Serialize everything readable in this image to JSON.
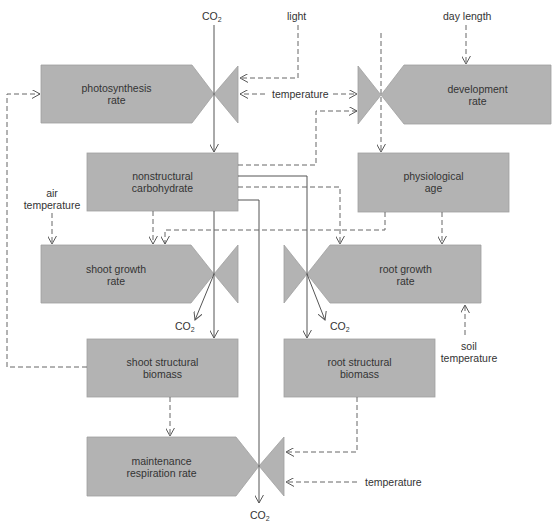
{
  "diagram": {
    "type": "flow/relational diagram (Forrester style)",
    "colors": {
      "box_fill": "#b3b3b3",
      "box_stroke": "#9a9a9a",
      "line": "#555555"
    },
    "nodes": {
      "photosynthesis": {
        "line1": "photosynthesis",
        "line2": "rate"
      },
      "development": {
        "line1": "development",
        "line2": "rate"
      },
      "nonstructural": {
        "line1": "nonstructural",
        "line2": "carbohydrate"
      },
      "physiological": {
        "line1": "physiological",
        "line2": "age"
      },
      "shoot_growth": {
        "line1": "shoot growth",
        "line2": "rate"
      },
      "root_growth": {
        "line1": "root growth",
        "line2": "rate"
      },
      "shoot_structural": {
        "line1": "shoot structural",
        "line2": "biomass"
      },
      "root_structural": {
        "line1": "root structural",
        "line2": "biomass"
      },
      "maintenance": {
        "line1": "maintenance",
        "line2": "respiration rate"
      }
    },
    "inputs": {
      "co2_top": "CO",
      "light": "light",
      "temperature_top": "temperature",
      "day_length": "day length",
      "air_temp_1": "air",
      "air_temp_2": "temperature",
      "soil_temp_1": "soil",
      "soil_temp_2": "temperature",
      "temperature_bottom": "temperature"
    },
    "outputs": {
      "co2_shoot": "CO",
      "co2_root": "CO",
      "co2_bottom": "CO"
    },
    "subscript": "2"
  }
}
